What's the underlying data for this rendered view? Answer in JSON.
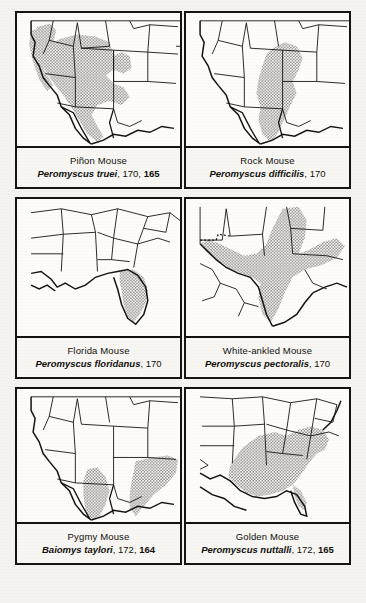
{
  "page": {
    "background_color": "#f4f3f0",
    "ink_color": "#15130f",
    "shade_color": "#9e9c95",
    "kind": "field-guide-range-map-plate",
    "columns": 2,
    "rows": 3
  },
  "panels": [
    {
      "id": "pinon-mouse",
      "common_name": "Piñon Mouse",
      "scientific_name": "Peromyscus truei",
      "page_refs": [
        "170",
        "165"
      ],
      "bold_ref": "165",
      "map_region": "western-united-states",
      "range_description": "Great Basin, Colorado Plateau and Southwest"
    },
    {
      "id": "rock-mouse",
      "common_name": "Rock Mouse",
      "scientific_name": "Peromyscus difficilis",
      "page_refs": [
        "170"
      ],
      "bold_ref": "",
      "map_region": "western-united-states",
      "range_description": "Southern Rockies south through eastern Mexican highlands"
    },
    {
      "id": "florida-mouse",
      "common_name": "Florida Mouse",
      "scientific_name": "Peromyscus floridanus",
      "page_refs": [
        "170"
      ],
      "bold_ref": "",
      "map_region": "southeastern-united-states",
      "range_description": "Peninsular Florida"
    },
    {
      "id": "white-ankled-mouse",
      "common_name": "White-ankled Mouse",
      "scientific_name": "Peromyscus pectoralis",
      "page_refs": [
        "170"
      ],
      "bold_ref": "",
      "map_region": "texas-and-northern-mexico",
      "range_description": "Edwards Plateau, Trans-Pecos and north-central Mexico"
    },
    {
      "id": "pygmy-mouse",
      "common_name": "Pygmy Mouse",
      "scientific_name": "Baiomys taylori",
      "page_refs": [
        "172",
        "164"
      ],
      "bold_ref": "164",
      "map_region": "southwestern-united-states",
      "range_description": "Southern Arizona, southern Texas and adjacent Mexico"
    },
    {
      "id": "golden-mouse",
      "common_name": "Golden Mouse",
      "scientific_name": "Peromyscus nuttalli",
      "page_refs": [
        "172",
        "165"
      ],
      "bold_ref": "165",
      "map_region": "southeastern-united-states",
      "range_description": "Southeastern states from Virginia to east Texas"
    }
  ]
}
